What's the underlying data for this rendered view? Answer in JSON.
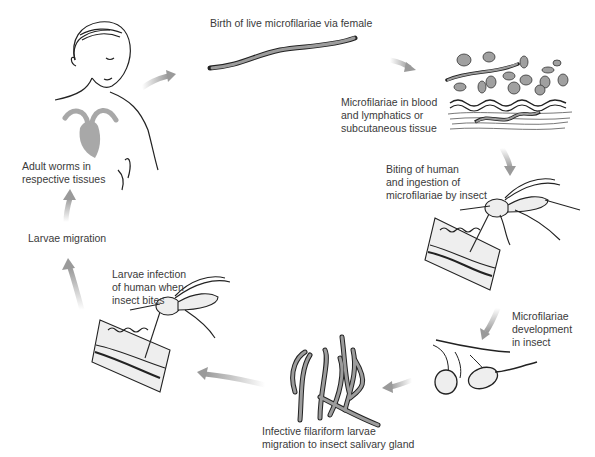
{
  "diagram": {
    "type": "life-cycle",
    "topic": "Filarial worm life cycle (human / insect vector)",
    "colors": {
      "arrow": "#9a9a9a",
      "line": "#222222",
      "fill": "#9c9c9c",
      "organ": "#a8a8a8",
      "background": "#ffffff"
    },
    "stages": [
      {
        "id": "adult-worms",
        "label_lines": [
          "Adult worms in",
          "respective tissues"
        ],
        "illustration": "human-with-heart"
      },
      {
        "id": "birth",
        "label_lines": [
          "Birth of live microfilariae via female"
        ],
        "illustration": "microfilaria-worm"
      },
      {
        "id": "blood",
        "label_lines": [
          "Microfilariae in blood",
          "and lymphatics or",
          "subcutaneous tissue"
        ],
        "illustration": "blood-cells-and-tissue"
      },
      {
        "id": "biting",
        "label_lines": [
          "Biting of human",
          "and ingestion of",
          "microfilariae by insect"
        ],
        "illustration": "mosquito-feeding"
      },
      {
        "id": "development",
        "label_lines": [
          "Microfilariae",
          "development",
          "in insect"
        ],
        "illustration": "insect-gut-cells"
      },
      {
        "id": "infective",
        "label_lines": [
          "Infective filariform larvae",
          "migration to insect salivary gland"
        ],
        "illustration": "filariform-larvae"
      },
      {
        "id": "infection",
        "label_lines": [
          "Larvae infection",
          "of human when",
          "insect bites"
        ],
        "illustration": "mosquito-biting"
      },
      {
        "id": "migration",
        "label_lines": [
          "Larvae migration"
        ],
        "illustration": "none"
      }
    ],
    "arrows": [
      {
        "from": "adult-worms",
        "to": "birth",
        "direction": "up-right"
      },
      {
        "from": "birth",
        "to": "blood",
        "direction": "right-down"
      },
      {
        "from": "blood",
        "to": "biting",
        "direction": "down"
      },
      {
        "from": "biting",
        "to": "development",
        "direction": "down-left"
      },
      {
        "from": "development",
        "to": "infective",
        "direction": "left"
      },
      {
        "from": "infective",
        "to": "infection",
        "direction": "left"
      },
      {
        "from": "infection",
        "to": "migration",
        "direction": "up"
      },
      {
        "from": "migration",
        "to": "adult-worms",
        "direction": "up"
      }
    ],
    "bottom_caption": {
      "legible": false,
      "note": "clipped by image edge"
    }
  }
}
